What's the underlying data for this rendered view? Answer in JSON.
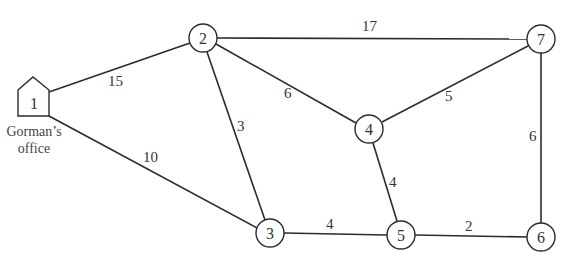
{
  "diagram": {
    "type": "weighted-network",
    "caption_lines": [
      "Gorman’s",
      "office"
    ],
    "nodes": [
      {
        "id": "1",
        "label": "1",
        "shape": "house",
        "x": 34,
        "y": 100
      },
      {
        "id": "2",
        "label": "2",
        "shape": "circle",
        "x": 203,
        "y": 38
      },
      {
        "id": "3",
        "label": "3",
        "shape": "circle",
        "x": 270,
        "y": 233
      },
      {
        "id": "4",
        "label": "4",
        "shape": "circle",
        "x": 369,
        "y": 129
      },
      {
        "id": "5",
        "label": "5",
        "shape": "circle",
        "x": 401,
        "y": 235
      },
      {
        "id": "6",
        "label": "6",
        "shape": "circle",
        "x": 541,
        "y": 237
      },
      {
        "id": "7",
        "label": "7",
        "shape": "circle",
        "x": 541,
        "y": 39
      }
    ],
    "edges": [
      {
        "from": "1",
        "to": "2",
        "weight": "15"
      },
      {
        "from": "1",
        "to": "3",
        "weight": "10"
      },
      {
        "from": "2",
        "to": "3",
        "weight": "3"
      },
      {
        "from": "2",
        "to": "4",
        "weight": "6"
      },
      {
        "from": "2",
        "to": "7",
        "weight": "17"
      },
      {
        "from": "4",
        "to": "7",
        "weight": "5"
      },
      {
        "from": "4",
        "to": "5",
        "weight": "4"
      },
      {
        "from": "3",
        "to": "5",
        "weight": "4"
      },
      {
        "from": "5",
        "to": "6",
        "weight": "2"
      },
      {
        "from": "7",
        "to": "6",
        "weight": "6"
      }
    ]
  }
}
